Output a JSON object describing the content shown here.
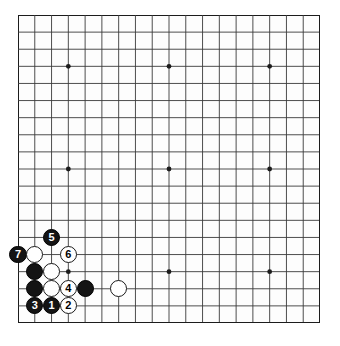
{
  "diagram": {
    "board": {
      "size": 19,
      "left": 18,
      "top": 15,
      "width": 302,
      "height": 308,
      "line_color": "#3a3a3a",
      "border_color": "#1c1c1c",
      "background_color": "#fdfdfd",
      "star_points": [
        {
          "col": 3,
          "row": 3
        },
        {
          "col": 9,
          "row": 3
        },
        {
          "col": 15,
          "row": 3
        },
        {
          "col": 3,
          "row": 9
        },
        {
          "col": 9,
          "row": 9
        },
        {
          "col": 15,
          "row": 9
        },
        {
          "col": 3,
          "row": 15
        },
        {
          "col": 9,
          "row": 15
        },
        {
          "col": 15,
          "row": 15
        }
      ]
    },
    "colors": {
      "black_stone": "#141414",
      "white_stone": "#ffffff",
      "black_label_text": "#ffffff",
      "white_label_text": "#000000"
    },
    "stones": [
      {
        "name": "stone-1-black",
        "color": "black",
        "label": "1",
        "col": 2,
        "row": 17
      },
      {
        "name": "stone-2-white",
        "color": "white",
        "label": "2",
        "col": 3,
        "row": 17
      },
      {
        "name": "stone-3-black",
        "color": "black",
        "label": "3",
        "col": 1,
        "row": 17
      },
      {
        "name": "stone-4-white",
        "color": "white",
        "label": "4",
        "col": 3,
        "row": 16
      },
      {
        "name": "stone-5-black",
        "color": "black",
        "label": "5",
        "col": 2,
        "row": 13
      },
      {
        "name": "stone-6-white",
        "color": "white",
        "label": "6",
        "col": 3,
        "row": 14
      },
      {
        "name": "stone-7-black",
        "color": "black",
        "label": "7",
        "col": 0,
        "row": 14
      },
      {
        "name": "stone-white-c2-r14",
        "color": "white",
        "label": "",
        "col": 1,
        "row": 14
      },
      {
        "name": "stone-black-c2-r15",
        "color": "black",
        "label": "",
        "col": 1,
        "row": 15
      },
      {
        "name": "stone-white-c3-r15",
        "color": "white",
        "label": "",
        "col": 2,
        "row": 15
      },
      {
        "name": "stone-black-c2-r16",
        "color": "black",
        "label": "",
        "col": 1,
        "row": 16
      },
      {
        "name": "stone-white-c3-r16",
        "color": "white",
        "label": "",
        "col": 2,
        "row": 16
      },
      {
        "name": "stone-black-c5-r16",
        "color": "black",
        "label": "",
        "col": 4,
        "row": 16
      },
      {
        "name": "stone-white-c7-r16",
        "color": "white",
        "label": "",
        "col": 6,
        "row": 16
      }
    ]
  }
}
